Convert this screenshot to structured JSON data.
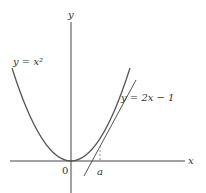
{
  "diagram": {
    "axes": {
      "x_label": "x",
      "y_label": "y",
      "origin_label": "0"
    },
    "curves": [
      {
        "name": "parabola",
        "label": "y = x²",
        "equation": "y = x^2"
      },
      {
        "name": "tangent",
        "label": "y = 2x − 1",
        "equation": "y = 2x - 1"
      }
    ],
    "marker": {
      "label": "a",
      "style": "dashed vertical line from tangent point to x-axis"
    },
    "colors": {
      "stroke": "#444444",
      "text": "#333333",
      "background": "#ffffff"
    }
  }
}
